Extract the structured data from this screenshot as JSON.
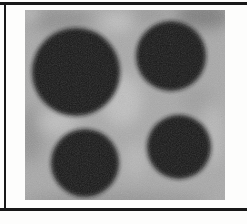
{
  "figure": {
    "alt": "Grayscale micrograph of four dark circular particles on a mottled gray background, framed by black rules on top, left and bottom",
    "frame": {
      "rule_color": "#181818",
      "background_color": "#fdfdfc"
    },
    "photo": {
      "width": 200,
      "height": 190,
      "base_gray": "#a9a9a9",
      "particle_color": "#191919",
      "grain_opacity": 0.22,
      "particles": [
        {
          "cx": 51,
          "cy": 62,
          "r": 44
        },
        {
          "cx": 146,
          "cy": 46,
          "r": 35
        },
        {
          "cx": 60,
          "cy": 153,
          "r": 34
        },
        {
          "cx": 154,
          "cy": 137,
          "r": 32
        }
      ],
      "shades": [
        {
          "cx": 178,
          "cy": 6,
          "rx": 28,
          "ry": 13,
          "color": "#6f6f6f",
          "opacity": 0.75
        },
        {
          "cx": 35,
          "cy": 10,
          "rx": 32,
          "ry": 12,
          "color": "#868686",
          "opacity": 0.7
        },
        {
          "cx": 125,
          "cy": 4,
          "rx": 18,
          "ry": 8,
          "color": "#8e8e8e",
          "opacity": 0.6
        },
        {
          "cx": 5,
          "cy": 125,
          "rx": 12,
          "ry": 28,
          "color": "#8a8a8a",
          "opacity": 0.7
        },
        {
          "cx": 90,
          "cy": 192,
          "rx": 95,
          "ry": 9,
          "color": "#8f8f8f",
          "opacity": 0.8
        },
        {
          "cx": 171,
          "cy": 90,
          "rx": 16,
          "ry": 14,
          "color": "#999999",
          "opacity": 0.6
        },
        {
          "cx": 92,
          "cy": 12,
          "rx": 16,
          "ry": 9,
          "color": "#c9c9c9",
          "opacity": 0.8
        },
        {
          "cx": 97,
          "cy": 90,
          "rx": 20,
          "ry": 26,
          "color": "#c4c4c4",
          "opacity": 0.85
        },
        {
          "cx": 33,
          "cy": 112,
          "rx": 20,
          "ry": 12,
          "color": "#c6c6c6",
          "opacity": 0.8
        },
        {
          "cx": 188,
          "cy": 125,
          "rx": 12,
          "ry": 30,
          "color": "#bcbcbc",
          "opacity": 0.8
        },
        {
          "cx": 5,
          "cy": 4,
          "rx": 10,
          "ry": 7,
          "color": "#c4c4c4",
          "opacity": 0.8
        },
        {
          "cx": 110,
          "cy": 150,
          "rx": 12,
          "ry": 18,
          "color": "#bdbdbd",
          "opacity": 0.7
        }
      ]
    }
  }
}
